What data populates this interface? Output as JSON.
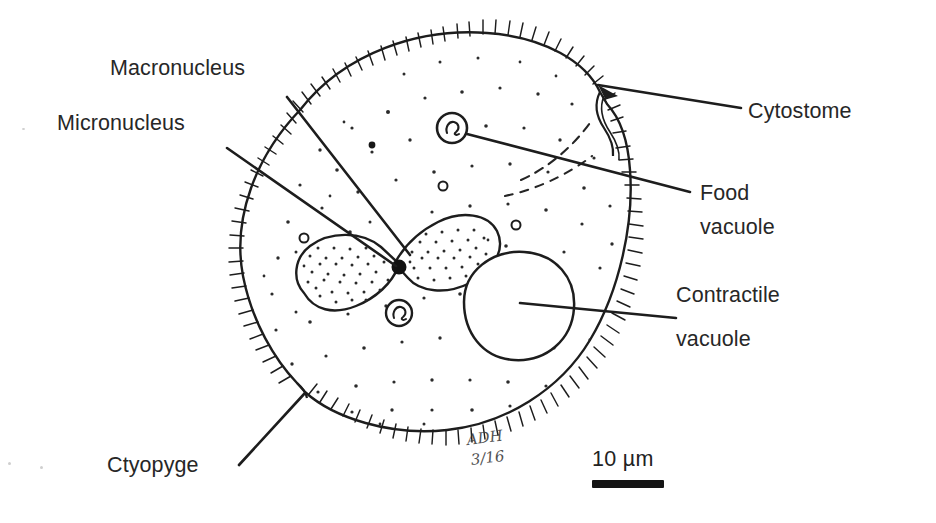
{
  "figure": {
    "background_color": "#ffffff",
    "ink_color": "#1b1b1b"
  },
  "labels": {
    "macronucleus": "Macronucleus",
    "micronucleus": "Micronucleus",
    "cytostome": "Cytostome",
    "food_vacuole_line1": "Food",
    "food_vacuole_line2": "vacuole",
    "contractile_vacuole_line1": "Contractile",
    "contractile_vacuole_line2": "vacuole",
    "cytopyge": "Ctyopyge"
  },
  "scale": {
    "value": "10",
    "unit": "µm",
    "text": "10 µm",
    "bar_length_px": 72
  },
  "annotation": {
    "initials": "ADH",
    "date": "3/16"
  },
  "structures": [
    {
      "name": "cell-membrane-pellicle",
      "description": "ovoid cell outline fringed with cilia"
    },
    {
      "name": "cilia-fringe",
      "description": "short radial hairs around entire membrane"
    },
    {
      "name": "cytoplasm-stipple",
      "description": "scattered dots filling cytoplasm"
    },
    {
      "name": "macronucleus",
      "description": "large bean-shaped stippled body"
    },
    {
      "name": "micronucleus",
      "description": "small solid black dot at macronucleus notch"
    },
    {
      "name": "contractile-vacuole",
      "description": "large empty circle, lower right"
    },
    {
      "name": "food-vacuole",
      "description": "small circle with inner contents, upper right"
    },
    {
      "name": "oral-groove",
      "description": "dashed curved lines leading to cytostome"
    },
    {
      "name": "cytostome",
      "description": "notch indentation at upper right margin"
    },
    {
      "name": "cytopyge",
      "description": "notch indentation at lower left margin"
    }
  ]
}
